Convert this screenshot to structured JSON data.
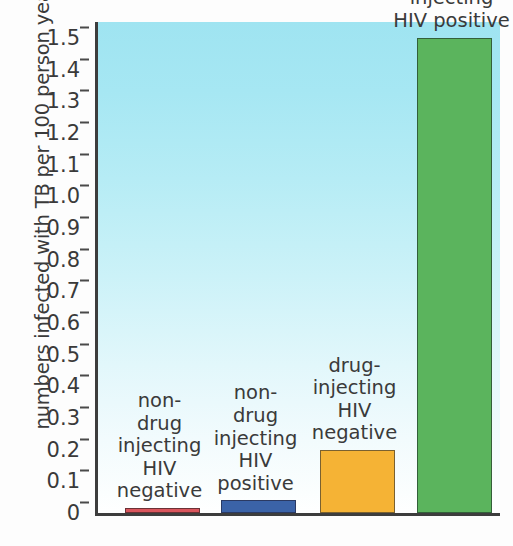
{
  "chart_data": {
    "type": "bar",
    "title": "",
    "subtitle": "",
    "xlabel": "",
    "ylabel": "numbers infected with TB per 100 person years",
    "ylim": [
      0,
      1.55
    ],
    "grid": false,
    "legend": "none",
    "yticks": [
      "0",
      "0.1",
      "0.2",
      "0.3",
      "0.4",
      "0.5",
      "0.6",
      "0.7",
      "0.8",
      "0.9",
      "1.0",
      "1.1",
      "1.2",
      "1.3",
      "1.4",
      "1.5"
    ],
    "ytick_values": [
      0,
      0.1,
      0.2,
      0.3,
      0.4,
      0.5,
      0.6,
      0.7,
      0.8,
      0.9,
      1.0,
      1.1,
      1.2,
      1.3,
      1.4,
      1.5
    ],
    "categories": [
      "non-\ndrug\ninjecting\nHIV\nnegative",
      "non-\ndrug\ninjecting\nHIV\npositive",
      "drug-\ninjecting\nHIV\nnegative",
      "drug-injecting\nHIV positive"
    ],
    "values": [
      0.01,
      0.04,
      0.2,
      1.5
    ],
    "colors": [
      "#d9555c",
      "#3b63a8",
      "#f5b335",
      "#5bb45d"
    ],
    "bar_labels_position": "above-bar"
  },
  "bars": [
    {
      "name": "non-drug-injecting-hiv-negative",
      "label": "non-\ndrug\ninjecting\nHIV\nnegative",
      "value": 0.01,
      "color": "#d9555c"
    },
    {
      "name": "non-drug-injecting-hiv-positive",
      "label": "non-\ndrug\ninjecting\nHIV\npositive",
      "value": 0.04,
      "color": "#3b63a8"
    },
    {
      "name": "drug-injecting-hiv-negative",
      "label": "drug-\ninjecting\nHIV\nnegative",
      "value": 0.2,
      "color": "#f5b335"
    },
    {
      "name": "drug-injecting-hiv-positive",
      "label": "drug-injecting\nHIV positive",
      "value": 1.5,
      "color": "#5bb45d"
    }
  ],
  "style": {
    "plot_background_top": "#9fe4f1",
    "plot_background_bottom": "#ffffff",
    "axis_color": "#3d3d3d",
    "text_color": "#3a3a3a"
  }
}
